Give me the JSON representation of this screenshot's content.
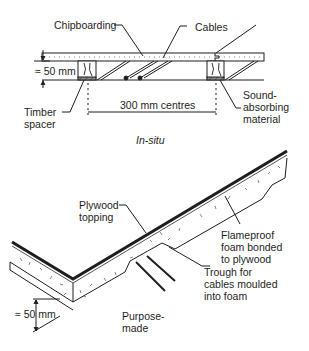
{
  "top_diagram": {
    "labels": {
      "chipboarding": "Chipboarding",
      "cables": "Cables",
      "dimension_height": "≈ 50 mm",
      "timber_spacer_1": "Timber",
      "timber_spacer_2": "spacer",
      "centres": "300 mm centres",
      "sound_1": "Sound-",
      "sound_2": "absorbing",
      "sound_3": "material"
    },
    "caption": "In-situ"
  },
  "bottom_diagram": {
    "labels": {
      "plywood_1": "Plywood",
      "plywood_2": "topping",
      "foam_1": "Flameproof",
      "foam_2": "foam bonded",
      "foam_3": "to plywood",
      "trough_1": "Trough for",
      "trough_2": "cables moulded",
      "trough_3": "into foam",
      "dimension_height": "≈ 50 mm"
    },
    "caption_1": "Purpose-",
    "caption_2": "made"
  },
  "colors": {
    "line": "#1e1e1e",
    "background": "#ffffff",
    "speckle": "#777777"
  }
}
